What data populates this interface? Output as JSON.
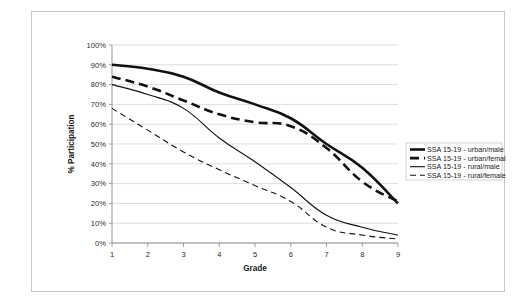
{
  "margin_note": "handwritten annotation (illegible)",
  "chart_data": {
    "type": "line",
    "title": "",
    "xlabel": "Grade",
    "ylabel": "% Participation",
    "x": [
      1,
      2,
      3,
      4,
      5,
      6,
      7,
      8,
      9
    ],
    "categories": [
      "1",
      "2",
      "3",
      "4",
      "5",
      "6",
      "7",
      "8",
      "9"
    ],
    "xlim": [
      1,
      9
    ],
    "ylim": [
      0,
      100
    ],
    "ytick_values": [
      0,
      10,
      20,
      30,
      40,
      50,
      60,
      70,
      80,
      90,
      100
    ],
    "ytick_labels": [
      "0%",
      "10%",
      "20%",
      "30%",
      "40%",
      "50%",
      "60%",
      "70%",
      "80%",
      "90%",
      "100%"
    ],
    "grid": true,
    "grid_axis": "y",
    "legend_position": "right",
    "series": [
      {
        "name": "SSA 15-19 - urban/male",
        "values": [
          90,
          88,
          84,
          76,
          70,
          63,
          50,
          38,
          20
        ],
        "style": "solid",
        "width": 2.6,
        "color": "#111111"
      },
      {
        "name": "SSA 15-19 - urban/female",
        "values": [
          84,
          79,
          72,
          65,
          61,
          59,
          48,
          31,
          21
        ],
        "style": "dashed",
        "width": 2.6,
        "color": "#111111"
      },
      {
        "name": "SSA 15-19 - rural/male",
        "values": [
          80,
          75,
          68,
          53,
          41,
          28,
          14,
          8,
          4
        ],
        "style": "solid",
        "width": 1.1,
        "color": "#111111"
      },
      {
        "name": "SSA 15-19 - rural/female",
        "values": [
          68,
          57,
          46,
          37,
          29,
          21,
          8,
          4,
          2
        ],
        "style": "dashed",
        "width": 1.1,
        "color": "#111111"
      }
    ]
  }
}
